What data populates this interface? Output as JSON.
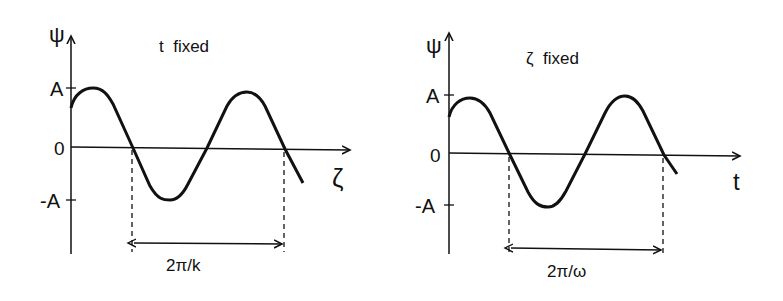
{
  "figure": {
    "left_panel": {
      "title": "t  fixed",
      "y_axis_label": "ψ",
      "x_axis_label": "ζ",
      "y_ticks": [
        "A",
        "0",
        "-A"
      ],
      "period_label": "2π/k"
    },
    "right_panel": {
      "title": "ζ  fixed",
      "y_axis_label": "ψ",
      "x_axis_label": "t",
      "y_ticks": [
        "A",
        "0",
        "-A"
      ],
      "period_label": "2π/ω"
    },
    "colors": {
      "ink": "#111111",
      "background": "#ffffff"
    }
  }
}
